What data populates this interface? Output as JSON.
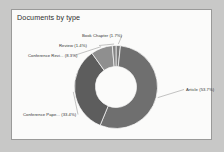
{
  "card": {
    "title": "Documents by type"
  },
  "chart_data": {
    "type": "pie",
    "variant": "donut",
    "title": "Documents by type",
    "xlabel": "",
    "ylabel": "",
    "grid": false,
    "legend_position": "none",
    "label_style": "outside-with-leader-lines",
    "units": "percent",
    "categories": [
      "Article",
      "Conference Pape...",
      "Conference Revi...",
      "Book Chapter",
      "Review"
    ],
    "values": [
      53.7,
      33.4,
      8.3,
      1.7,
      1.4
    ],
    "labels": [
      "Article (53.7%)",
      "Conference Pape... (33.4%)",
      "Conference Revi... (8.3%)",
      "Book Chapter (1.7%)",
      "Review (1.4%)"
    ],
    "colors": [
      "#6f6f6f",
      "#5d5d5d",
      "#8f8f8f",
      "#7a7a7a",
      "#848484"
    ],
    "slice_names": [
      "slice-article",
      "slice-conference-paper",
      "slice-conference-review",
      "slice-book-chapter",
      "slice-review"
    ],
    "hole_color": "#fbfbfa",
    "separator_color": "#fbfbfa",
    "start_angle_deg": 0
  },
  "labels": {
    "article": "Article (53.7%)",
    "conference_paper": "Conference Pape... (33.4%)",
    "conference_review": "Conference Revi... (8.3%)",
    "book_chapter": "Book Chapter (1.7%)",
    "review": "Review (1.4%)"
  }
}
